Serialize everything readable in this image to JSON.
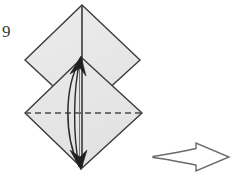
{
  "figure": {
    "kind": "origami-fold-diagram",
    "step_label": "9",
    "background_color": "#ffffff",
    "paper_fill": "#e8e8e8",
    "paper_fill_lower": "#e5e5e5",
    "outline_color": "#3c3c3c",
    "crease_color": "#555555",
    "arrow_color": "#2b2b2b",
    "next_arrow_color": "#6b6b6b"
  },
  "shapes": {
    "upper_diamond": {
      "name": "upper-square-panel",
      "points": "82,5 140,60 82,113 25,60",
      "description": "upper rotated square (diamond) of paper"
    },
    "lower_diamond": {
      "name": "lower-square-panel",
      "points": "82,58 142,113 82,168 25,113",
      "description": "lower rotated square (diamond) of paper overlapping the upper one"
    },
    "vertical_center_line": {
      "name": "vertical-center-crease",
      "x": 82,
      "y1": 5,
      "y2": 168
    },
    "horizontal_dashed_line": {
      "name": "valley-fold-dashed-line",
      "y": 113,
      "x1": 25,
      "x2": 142,
      "style": "dashed",
      "meaning": "valley fold"
    }
  },
  "annotations": {
    "double_arrow": {
      "name": "double-headed-fold-arrow",
      "head_top": "82,58",
      "head_bottom": "82,168",
      "meaning": "fold point up and back down / swing flap"
    },
    "next_step_arrow": {
      "name": "next-step-arrow",
      "direction": "right",
      "x1": 153,
      "x2": 230,
      "y": 157,
      "style": "hollow-outline"
    }
  }
}
